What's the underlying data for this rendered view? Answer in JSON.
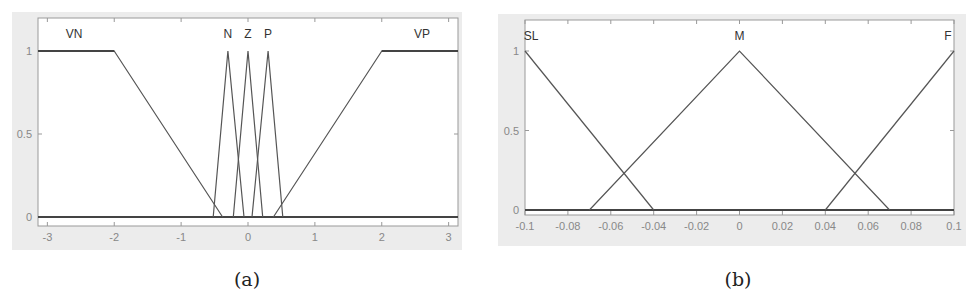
{
  "chart_data": [
    {
      "id": "a",
      "type": "line",
      "title": "",
      "caption": "(a)",
      "xlabel": "",
      "ylabel": "",
      "xlim": [
        -3.14,
        3.14
      ],
      "ylim": [
        0,
        1.2
      ],
      "xticks": [
        -3,
        -2,
        -1,
        0,
        1,
        2,
        3
      ],
      "xtick_labels": [
        "-3",
        "-2",
        "-1",
        "0",
        "1",
        "2",
        "3"
      ],
      "yticks": [
        0,
        0.5,
        1
      ],
      "ytick_labels": [
        "0",
        "0.5",
        "1"
      ],
      "grid": false,
      "legend": "none (labels above curves)",
      "series": [
        {
          "name": "VN",
          "shape": "trapezoid",
          "x": [
            -3.14,
            -2,
            -0.38
          ],
          "y": [
            1,
            1,
            0
          ],
          "label_x": -2.6
        },
        {
          "name": "N",
          "shape": "triangle",
          "x": [
            -0.52,
            -0.3,
            -0.06
          ],
          "y": [
            0,
            1,
            0
          ],
          "label_x": -0.3
        },
        {
          "name": "Z",
          "shape": "triangle",
          "x": [
            -0.22,
            0,
            0.22
          ],
          "y": [
            0,
            1,
            0
          ],
          "label_x": 0
        },
        {
          "name": "P",
          "shape": "triangle",
          "x": [
            0.06,
            0.3,
            0.52
          ],
          "y": [
            0,
            1,
            0
          ],
          "label_x": 0.3
        },
        {
          "name": "VP",
          "shape": "trapezoid",
          "x": [
            0.38,
            2,
            3.14
          ],
          "y": [
            0,
            1,
            1
          ],
          "label_x": 2.6
        }
      ]
    },
    {
      "id": "b",
      "type": "line",
      "title": "",
      "caption": "(b)",
      "xlabel": "",
      "ylabel": "",
      "xlim": [
        -0.1,
        0.1
      ],
      "ylim": [
        0,
        1.15
      ],
      "xticks": [
        -0.1,
        -0.08,
        -0.06,
        -0.04,
        -0.02,
        0,
        0.02,
        0.04,
        0.06,
        0.08,
        0.1
      ],
      "xtick_labels": [
        "-0.1",
        "-0.08",
        "-0.06",
        "-0.04",
        "-0.02",
        "0",
        "0.02",
        "0.04",
        "0.06",
        "0.08",
        "0.1"
      ],
      "yticks": [
        0,
        0.5,
        1
      ],
      "ytick_labels": [
        "0",
        "0.5",
        "1"
      ],
      "grid": false,
      "legend": "none (labels above curves)",
      "series": [
        {
          "name": "SL",
          "shape": "triangle",
          "x": [
            -0.1,
            -0.04
          ],
          "y": [
            1,
            0
          ],
          "label_x": -0.1
        },
        {
          "name": "M",
          "shape": "triangle",
          "x": [
            -0.07,
            0,
            0.07
          ],
          "y": [
            0,
            1,
            0
          ],
          "label_x": 0
        },
        {
          "name": "F",
          "shape": "triangle",
          "x": [
            0.04,
            0.1
          ],
          "y": [
            0,
            1
          ],
          "label_x": 0.1
        }
      ]
    }
  ],
  "colors": {
    "panel_bg": "#ececec",
    "plot_bg": "#ffffff",
    "curve": "#555555",
    "frame": "#999999",
    "baseline": "#444444"
  }
}
